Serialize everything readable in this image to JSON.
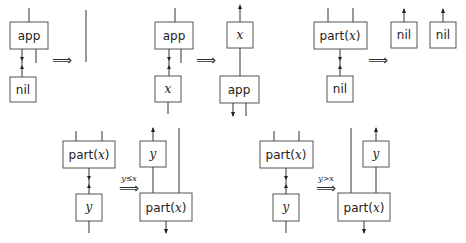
{
  "rules": [
    {
      "id": "app-nil",
      "lhs": {
        "top": "app",
        "bottom": "nil"
      },
      "arrow": "⟹",
      "condition": "",
      "rhs": "wire"
    },
    {
      "id": "app-x",
      "lhs": {
        "top": "app",
        "bottom": "x"
      },
      "arrow": "⟹",
      "condition": "",
      "rhs": {
        "top": "x",
        "bottom": "app"
      }
    },
    {
      "id": "part-nil",
      "lhs": {
        "top": "part(x)",
        "bottom": "nil"
      },
      "arrow": "⟹",
      "condition": "",
      "rhs": {
        "left": "nil",
        "right": "nil"
      }
    },
    {
      "id": "part-y-le",
      "lhs": {
        "top": "part(x)",
        "bottom": "y"
      },
      "arrow": "⟹",
      "condition": "y≤x",
      "rhs": {
        "top": "y",
        "bottom": "part(x)"
      }
    },
    {
      "id": "part-y-gt",
      "lhs": {
        "top": "part(x)",
        "bottom": "y"
      },
      "arrow": "⟹",
      "condition": "y>x",
      "rhs": {
        "top": "y",
        "bottom": "part(x)"
      }
    }
  ],
  "labels": {
    "app": "app",
    "nil": "nil",
    "x": "x",
    "y": "y",
    "part_prefix": "part(",
    "part_x": "x",
    "part_suffix": ")",
    "arrow": "⟹",
    "cond_le": "y≤x",
    "cond_gt": "y>x"
  }
}
